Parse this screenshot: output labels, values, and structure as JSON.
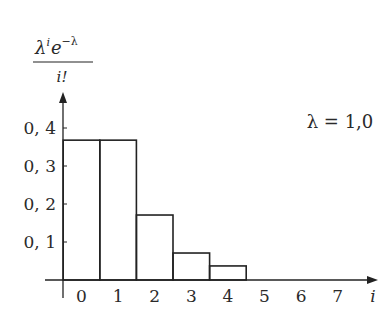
{
  "chart_data": {
    "type": "bar",
    "title": "",
    "ylabel": {
      "numerator_base1": "λ",
      "numerator_sup1": "i",
      "numerator_base2": "e",
      "numerator_sup2": "−λ",
      "denominator": "i!"
    },
    "xlabel": "i",
    "annotation": "λ = 1,0",
    "categories": [
      0,
      1,
      2,
      3,
      4
    ],
    "values": [
      0.368,
      0.368,
      0.171,
      0.071,
      0.037
    ],
    "x_ticks": [
      "0",
      "1",
      "2",
      "3",
      "4",
      "5",
      "6",
      "7"
    ],
    "y_ticks": [
      {
        "value": 0.1,
        "label": "0, 1"
      },
      {
        "value": 0.2,
        "label": "0, 2"
      },
      {
        "value": 0.3,
        "label": "0, 3"
      },
      {
        "value": 0.4,
        "label": "0, 4"
      }
    ],
    "ylim": [
      0,
      0.45
    ],
    "xlim": [
      -0.5,
      8
    ],
    "grid": false,
    "legend": null,
    "bar_style": "outlined, adjacent (histogram)"
  }
}
